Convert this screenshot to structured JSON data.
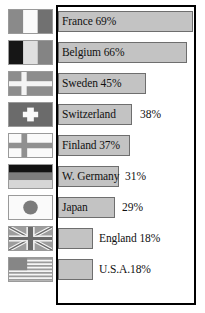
{
  "chart_data": {
    "type": "bar",
    "title": "",
    "xlabel": "",
    "ylabel": "",
    "grid": false,
    "legend": "none",
    "orientation": "horizontal",
    "value_suffix": "%",
    "xlim": [
      0,
      72
    ],
    "categories": [
      "France",
      "Belgium",
      "Sweden",
      "Switzerland",
      "Finland",
      "W. Germany",
      "Japan",
      "England",
      "U.S.A."
    ],
    "values": [
      69,
      66,
      45,
      38,
      37,
      31,
      29,
      18,
      18
    ],
    "labels": [
      "France 69%",
      "Belgium 66%",
      "Sweden 45%",
      "Switzerland",
      "Finland 37%",
      "W. Germany",
      "Japan",
      "England 18%",
      "U.S.A.18%"
    ],
    "annotations": [
      "",
      "",
      "",
      "38%",
      "",
      "31%",
      "29%",
      "",
      ""
    ]
  },
  "colors": {
    "bar_fill": "#c3c3c3",
    "bar_stroke": "#6e6e6e",
    "frame_stroke": "#000000",
    "background": "#ffffff",
    "text": "#111111",
    "flag_gray_dark": "#6f6f6f",
    "flag_gray_mid": "#9a9a9a",
    "flag_gray_light": "#cfcfcf",
    "flag_black": "#141414",
    "flag_white": "#f7f7f7"
  },
  "rows": [
    {
      "country": "France",
      "value": 69,
      "label": "France 69%",
      "label_inside": true,
      "value_outside": "",
      "flag_icon": "flag-france-icon",
      "bar_width_px": 135
    },
    {
      "country": "Belgium",
      "value": 66,
      "label": "Belgium 66%",
      "label_inside": true,
      "value_outside": "",
      "flag_icon": "flag-belgium-icon",
      "bar_width_px": 129
    },
    {
      "country": "Sweden",
      "value": 45,
      "label": "Sweden 45%",
      "label_inside": true,
      "value_outside": "",
      "flag_icon": "flag-sweden-icon",
      "bar_width_px": 88
    },
    {
      "country": "Switzerland",
      "value": 38,
      "label": "Switzerland",
      "label_inside": true,
      "value_outside": "38%",
      "flag_icon": "flag-switzerland-icon",
      "bar_width_px": 74
    },
    {
      "country": "Finland",
      "value": 37,
      "label": "Finland 37%",
      "label_inside": true,
      "value_outside": "",
      "flag_icon": "flag-finland-icon",
      "bar_width_px": 72
    },
    {
      "country": "W. Germany",
      "value": 31,
      "label": "W. Germany",
      "label_inside": true,
      "value_outside": "31%",
      "flag_icon": "flag-west-germany-icon",
      "bar_width_px": 61
    },
    {
      "country": "Japan",
      "value": 29,
      "label": "Japan",
      "label_inside": true,
      "value_outside": "29%",
      "flag_icon": "flag-japan-icon",
      "bar_width_px": 57
    },
    {
      "country": "England",
      "value": 18,
      "label": "England 18%",
      "label_inside": false,
      "value_outside": "",
      "flag_icon": "flag-england-icon",
      "bar_width_px": 35
    },
    {
      "country": "U.S.A.",
      "value": 18,
      "label": "U.S.A.18%",
      "label_inside": false,
      "value_outside": "",
      "flag_icon": "flag-usa-icon",
      "bar_width_px": 35
    }
  ]
}
